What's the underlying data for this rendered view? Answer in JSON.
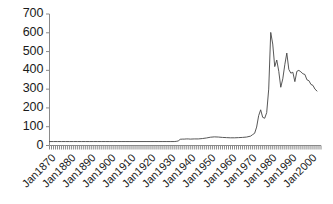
{
  "chart_data": {
    "type": "line",
    "title": "",
    "subtitle": "",
    "xlabel": "",
    "ylabel": "",
    "xlim": [
      "Jan1870",
      "Jan2005"
    ],
    "ylim": [
      0,
      700
    ],
    "ytick_labels": [
      "700",
      "600",
      "500",
      "400",
      "300",
      "200",
      "100",
      "0"
    ],
    "ytick_values": [
      700,
      600,
      500,
      400,
      300,
      200,
      100,
      0
    ],
    "xtick_labels": [
      "Jan1870",
      "Jan1880",
      "Jan1890",
      "Jan1900",
      "Jan1910",
      "Jan1920",
      "Jan1930",
      "Jan1940",
      "Jan1950",
      "Jan1960",
      "Jan1970",
      "Jan1980",
      "Jan1990",
      "Jan2000"
    ],
    "xtick_values": [
      1870,
      1880,
      1890,
      1900,
      1910,
      1920,
      1930,
      1940,
      1950,
      1960,
      1970,
      1980,
      1990,
      2000
    ],
    "grid": false,
    "legend": "none",
    "line_color": "#444444",
    "axis_color": "#888888",
    "background_color": "#ffffff",
    "series": [
      {
        "name": "series-1",
        "x": [
          1870,
          1872,
          1874,
          1876,
          1878,
          1880,
          1882,
          1884,
          1886,
          1888,
          1890,
          1892,
          1894,
          1896,
          1898,
          1900,
          1902,
          1904,
          1906,
          1908,
          1910,
          1912,
          1914,
          1916,
          1918,
          1920,
          1922,
          1924,
          1926,
          1928,
          1930,
          1932,
          1933,
          1934,
          1935,
          1936,
          1937,
          1938,
          1939,
          1940,
          1942,
          1944,
          1946,
          1948,
          1950,
          1952,
          1954,
          1956,
          1958,
          1960,
          1962,
          1964,
          1966,
          1968,
          1970,
          1971,
          1972,
          1973,
          1974,
          1975,
          1976,
          1977,
          1978,
          1979,
          1980,
          1981,
          1982,
          1983,
          1984,
          1985,
          1986,
          1987,
          1988,
          1989,
          1990,
          1991,
          1992,
          1993,
          1994,
          1995,
          1996,
          1997,
          1998,
          1999,
          2000,
          2001,
          2002,
          2003
        ],
        "values": [
          21,
          21,
          21,
          21,
          21,
          21,
          21,
          21,
          21,
          21,
          21,
          21,
          21,
          21,
          21,
          21,
          21,
          21,
          21,
          21,
          21,
          21,
          21,
          21,
          21,
          21,
          21,
          21,
          21,
          21,
          21,
          21,
          22,
          24,
          33,
          34,
          34,
          35,
          35,
          34,
          35,
          35,
          37,
          40,
          44,
          46,
          45,
          43,
          42,
          41,
          41,
          42,
          43,
          45,
          50,
          58,
          65,
          98,
          159,
          190,
          150,
          145,
          175,
          300,
          602,
          540,
          420,
          455,
          395,
          310,
          355,
          430,
          492,
          405,
          385,
          390,
          340,
          395,
          400,
          392,
          382,
          378,
          350,
          345,
          325,
          320,
          300,
          290
        ]
      }
    ]
  },
  "axes": {
    "x_axis_name": "time-axis",
    "y_axis_name": "value-axis"
  }
}
